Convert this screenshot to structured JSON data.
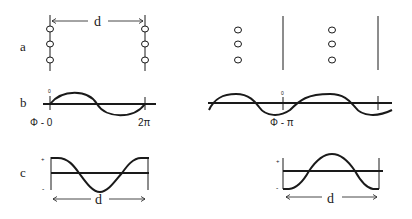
{
  "row_labels": {
    "a": "a",
    "b": "b",
    "c": "c"
  },
  "distance_label": "d",
  "row_b": {
    "left_phase_label": "Φ - 0",
    "left_end_label": "2π",
    "right_phase_label": "Φ - π",
    "zero_tick": "0"
  },
  "row_c": {
    "plus": "+",
    "minus": "-"
  },
  "colors": {
    "ink": "#1a1a1a",
    "background": "#ffffff"
  }
}
